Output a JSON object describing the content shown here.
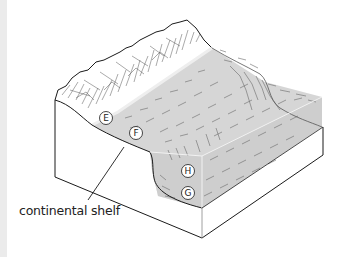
{
  "figure": {
    "type": "block diagram of ocean floor (continental margin)",
    "labels": [
      {
        "id": "E",
        "text": "E",
        "cx": 106,
        "cy": 118
      },
      {
        "id": "F",
        "text": "F",
        "cx": 136,
        "cy": 133
      },
      {
        "id": "H",
        "text": "H",
        "cx": 188,
        "cy": 171
      },
      {
        "id": "G",
        "text": "G",
        "cx": 188,
        "cy": 193
      }
    ],
    "callout": {
      "text": "continental shelf"
    }
  },
  "colors": {
    "water": "#d4d4d4",
    "land": "#ffffff",
    "line": "#1a1a1a",
    "strip": "#ebebeb"
  }
}
